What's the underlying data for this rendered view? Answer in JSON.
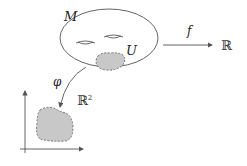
{
  "diagram": {
    "type": "manifold-chart-map",
    "labels": {
      "manifold": "M",
      "open_set": "U",
      "function": "f",
      "chart_map": "φ",
      "reals": "ℝ",
      "plane": "ℝ",
      "plane_superscript": "2"
    },
    "nodes": [
      {
        "id": "M",
        "shape": "torus-ellipse",
        "label": "M"
      },
      {
        "id": "U",
        "shape": "dashed-blob",
        "label": "U",
        "parent": "M"
      },
      {
        "id": "R",
        "shape": "text",
        "label": "ℝ"
      },
      {
        "id": "R2",
        "shape": "axes-with-dashed-blob",
        "label": "ℝ²"
      }
    ],
    "edges": [
      {
        "from": "M",
        "to": "R",
        "label": "f",
        "style": "straight-arrow"
      },
      {
        "from": "U",
        "to": "R2",
        "label": "φ",
        "style": "curved-arrow"
      }
    ],
    "colors": {
      "stroke": "#555555",
      "fill_region": "#c8c8c8",
      "text": "#222222"
    }
  }
}
